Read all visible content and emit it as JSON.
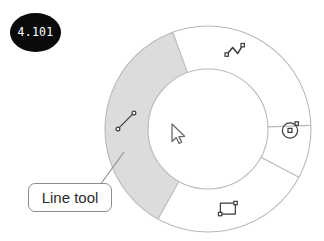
{
  "step_badge": {
    "label": "4.101"
  },
  "callout": {
    "label": "Line tool",
    "target_segment": "line-tool"
  },
  "radial_menu": {
    "center_x": 208,
    "center_y": 129,
    "outer_radius": 103,
    "inner_radius": 60,
    "active_segment_id": "line-tool",
    "colors": {
      "active_fill": "#dcdcdc",
      "inactive_fill": "#ffffff",
      "ring_stroke": "#b9b9b9",
      "icon_stroke": "#3a3a3a",
      "callout_border": "#8d8d8d",
      "badge_background": "#0a0a0a",
      "badge_text": "#ffffff"
    },
    "segments": [
      {
        "id": "line-tool",
        "icon": "line-tool-icon",
        "label": "Line tool",
        "active": true,
        "start_angle": 119,
        "end_angle": 250,
        "icon_angle": 186,
        "icon_radius": 82
      },
      {
        "id": "polyline-tool",
        "icon": "polyline-tool-icon",
        "label": "Polyline tool",
        "active": false,
        "start_angle": 250,
        "end_angle": 358,
        "icon_angle": 289,
        "icon_radius": 82
      },
      {
        "id": "circle-tool",
        "icon": "circle-tool-icon",
        "label": "Circle tool",
        "active": false,
        "start_angle": 358,
        "end_angle": 28,
        "icon_angle": 1,
        "icon_radius": 82
      },
      {
        "id": "rectangle-tool",
        "icon": "rectangle-tool-icon",
        "label": "Rectangle tool",
        "active": false,
        "start_angle": 28,
        "end_angle": 119,
        "icon_angle": 76,
        "icon_radius": 82
      }
    ]
  },
  "cursor": {
    "icon": "mouse-pointer-icon",
    "x": 172,
    "y": 124
  },
  "leader_line": {
    "from_x": 124,
    "from_y": 152,
    "to_x": 100,
    "to_y": 185
  }
}
